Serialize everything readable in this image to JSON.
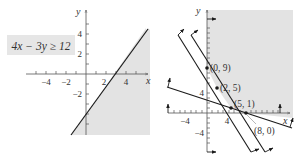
{
  "left_graph": {
    "inequality_label": "4x − 3y ≥ 12",
    "x_axis_label": "x",
    "y_axis_label": "y",
    "x_ticks": [
      {
        "value": -4,
        "label": "−4"
      },
      {
        "value": -2,
        "label": "−2"
      },
      {
        "value": 2,
        "label": "2"
      },
      {
        "value": 4,
        "label": "4"
      }
    ],
    "y_ticks": [
      {
        "value": 4,
        "label": "4"
      },
      {
        "value": 2,
        "label": "2"
      },
      {
        "value": -2,
        "label": "−2"
      }
    ],
    "boundary_line": "4x − 3y = 12",
    "shaded_side": "below-right",
    "colors": {
      "shade": "#e3e3e3",
      "line": "#1a1a1a",
      "label_box": "#e6e6e6"
    }
  },
  "right_graph": {
    "x_axis_label": "x",
    "y_axis_label": "y",
    "x_ticks": [
      {
        "value": -4,
        "label": "−4"
      },
      {
        "value": 4,
        "label": "4"
      }
    ],
    "y_ticks": [
      {
        "value": 4,
        "label": "4"
      },
      {
        "value": -4,
        "label": "−4"
      }
    ],
    "vertices": [
      {
        "label": "(0, 9)",
        "x": 0,
        "y": 9
      },
      {
        "label": "(2, 5)",
        "x": 2,
        "y": 5
      },
      {
        "label": "(5, 1)",
        "x": 5,
        "y": 1
      },
      {
        "label": "(8, 0)",
        "x": 8,
        "y": 0
      }
    ],
    "colors": {
      "shade": "#e3e3e3",
      "line": "#1a1a1a"
    }
  }
}
